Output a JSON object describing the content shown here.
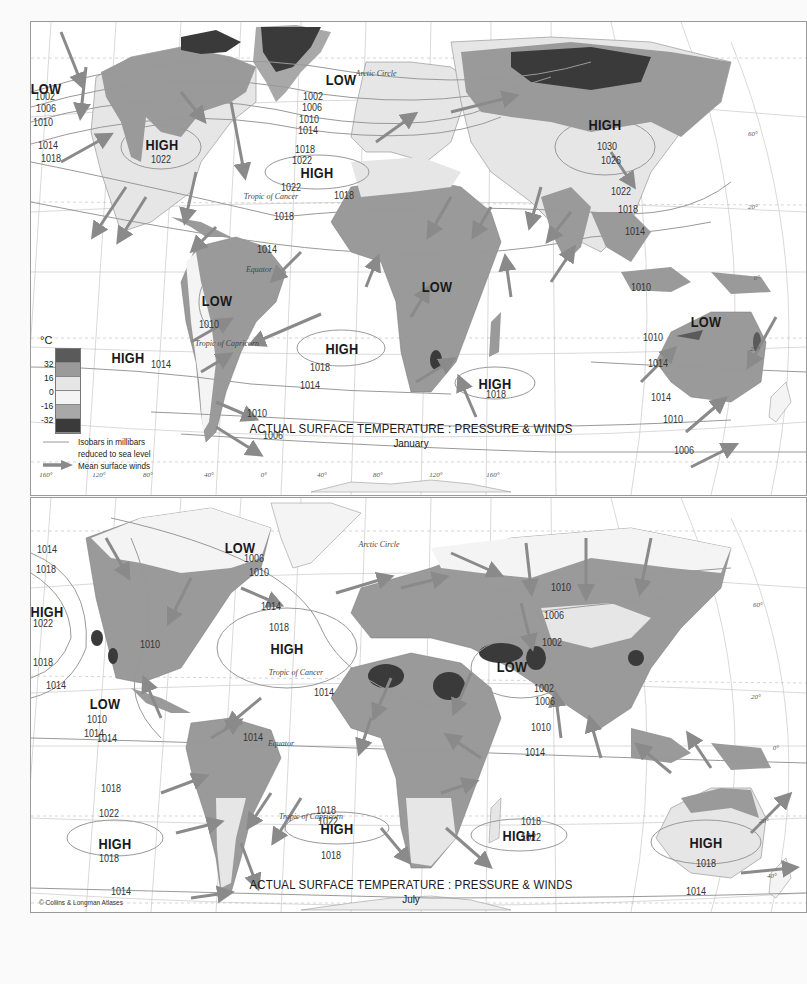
{
  "colors": {
    "temp_above_32": "#5a5a5a",
    "temp_16_32": "#9a9a9a",
    "temp_0_16": "#e6e6e6",
    "temp_minus16_0": "#f4f4f4",
    "temp_minus32_minus16": "#a8a8a8",
    "temp_below_minus32": "#3a3a3a",
    "ocean": "#ffffff",
    "isobar": "#999999",
    "wind_arrow": "#8a8a8a",
    "graticule": "#c8c8c8"
  },
  "legend": {
    "unit": "°C",
    "scale_values": [
      "32",
      "16",
      "0",
      "-16",
      "-32"
    ],
    "scale_swatches": [
      "#5a5a5a",
      "#9a9a9a",
      "#e6e6e6",
      "#f4f4f4",
      "#a8a8a8",
      "#3a3a3a"
    ],
    "isobar_key_line1": "Isobars in millibars",
    "isobar_key_line2": "reduced to sea level",
    "wind_key": "Mean surface winds"
  },
  "january": {
    "title": "ACTUAL SURFACE TEMPERATURE : PRESSURE & WINDS",
    "subtitle": "January",
    "pressure_centers": [
      {
        "label": "LOW",
        "x": 15,
        "y": 66
      },
      {
        "label": "HIGH",
        "x": 131,
        "y": 122
      },
      {
        "label": "LOW",
        "x": 310,
        "y": 57
      },
      {
        "label": "HIGH",
        "x": 286,
        "y": 150
      },
      {
        "label": "HIGH",
        "x": 574,
        "y": 102
      },
      {
        "label": "LOW",
        "x": 186,
        "y": 278
      },
      {
        "label": "LOW",
        "x": 406,
        "y": 264
      },
      {
        "label": "HIGH",
        "x": 311,
        "y": 326
      },
      {
        "label": "HIGH",
        "x": 97,
        "y": 335
      },
      {
        "label": "HIGH",
        "x": 464,
        "y": 361
      },
      {
        "label": "LOW",
        "x": 675,
        "y": 299
      }
    ],
    "isobars": [
      {
        "value": "1002",
        "x": 14,
        "y": 75
      },
      {
        "value": "1006",
        "x": 15,
        "y": 87
      },
      {
        "value": "1010",
        "x": 12,
        "y": 101
      },
      {
        "value": "1014",
        "x": 17,
        "y": 124
      },
      {
        "value": "1018",
        "x": 20,
        "y": 137
      },
      {
        "value": "1022",
        "x": 130,
        "y": 138
      },
      {
        "value": "1002",
        "x": 282,
        "y": 75
      },
      {
        "value": "1006",
        "x": 281,
        "y": 86
      },
      {
        "value": "1010",
        "x": 278,
        "y": 98
      },
      {
        "value": "1014",
        "x": 277,
        "y": 109
      },
      {
        "value": "1018",
        "x": 274,
        "y": 128
      },
      {
        "value": "1022",
        "x": 271,
        "y": 139
      },
      {
        "value": "1022",
        "x": 260,
        "y": 166
      },
      {
        "value": "1018",
        "x": 253,
        "y": 195
      },
      {
        "value": "1030",
        "x": 576,
        "y": 125
      },
      {
        "value": "1026",
        "x": 580,
        "y": 139
      },
      {
        "value": "1022",
        "x": 590,
        "y": 170
      },
      {
        "value": "1018",
        "x": 597,
        "y": 188
      },
      {
        "value": "1014",
        "x": 604,
        "y": 210
      },
      {
        "value": "1010",
        "x": 610,
        "y": 266
      },
      {
        "value": "1014",
        "x": 236,
        "y": 228
      },
      {
        "value": "1010",
        "x": 178,
        "y": 303
      },
      {
        "value": "1018",
        "x": 289,
        "y": 346
      },
      {
        "value": "1014",
        "x": 130,
        "y": 343
      },
      {
        "value": "1014",
        "x": 279,
        "y": 364
      },
      {
        "value": "1018",
        "x": 313,
        "y": 174
      },
      {
        "value": "1018",
        "x": 465,
        "y": 373
      },
      {
        "value": "1010",
        "x": 226,
        "y": 392
      },
      {
        "value": "1006",
        "x": 242,
        "y": 414
      },
      {
        "value": "1010",
        "x": 622,
        "y": 316
      },
      {
        "value": "1014",
        "x": 627,
        "y": 342
      },
      {
        "value": "1014",
        "x": 630,
        "y": 376
      },
      {
        "value": "1010",
        "x": 642,
        "y": 398
      },
      {
        "value": "1006",
        "x": 653,
        "y": 429
      }
    ],
    "parallels": [
      {
        "label": "Arctic Circle",
        "x": 345,
        "y": 52
      },
      {
        "label": "Tropic of Cancer",
        "x": 240,
        "y": 175
      },
      {
        "label": "Equator",
        "x": 228,
        "y": 248
      },
      {
        "label": "Tropic of Capricorn",
        "x": 196,
        "y": 322
      }
    ],
    "ticks": [
      {
        "label": "60°",
        "x": 722,
        "y": 112
      },
      {
        "label": "20°",
        "x": 722,
        "y": 185
      },
      {
        "label": "0°",
        "x": 726,
        "y": 256
      },
      {
        "label": "20°",
        "x": 724,
        "y": 327
      },
      {
        "label": "160°",
        "x": 15,
        "y": 453
      },
      {
        "label": "120°",
        "x": 68,
        "y": 453
      },
      {
        "label": "80°",
        "x": 117,
        "y": 453
      },
      {
        "label": "40°",
        "x": 178,
        "y": 453
      },
      {
        "label": "0°",
        "x": 233,
        "y": 453
      },
      {
        "label": "40°",
        "x": 291,
        "y": 453
      },
      {
        "label": "80°",
        "x": 347,
        "y": 453
      },
      {
        "label": "120°",
        "x": 405,
        "y": 453
      },
      {
        "label": "160°",
        "x": 462,
        "y": 453
      }
    ]
  },
  "july": {
    "title": "ACTUAL SURFACE TEMPERATURE : PRESSURE & WINDS",
    "subtitle": "July",
    "pressure_centers": [
      {
        "label": "LOW",
        "x": 209,
        "y": 49
      },
      {
        "label": "HIGH",
        "x": 16,
        "y": 113
      },
      {
        "label": "HIGH",
        "x": 256,
        "y": 150
      },
      {
        "label": "LOW",
        "x": 481,
        "y": 168
      },
      {
        "label": "LOW",
        "x": 74,
        "y": 205
      },
      {
        "label": "HIGH",
        "x": 84,
        "y": 345
      },
      {
        "label": "HIGH",
        "x": 306,
        "y": 330
      },
      {
        "label": "HIGH",
        "x": 488,
        "y": 337
      },
      {
        "label": "HIGH",
        "x": 675,
        "y": 344
      }
    ],
    "isobars": [
      {
        "value": "1014",
        "x": 16,
        "y": 52
      },
      {
        "value": "1018",
        "x": 15,
        "y": 72
      },
      {
        "value": "1022",
        "x": 12,
        "y": 126
      },
      {
        "value": "1018",
        "x": 12,
        "y": 165
      },
      {
        "value": "1014",
        "x": 25,
        "y": 188
      },
      {
        "value": "1010",
        "x": 119,
        "y": 147
      },
      {
        "value": "1006",
        "x": 223,
        "y": 61
      },
      {
        "value": "1010",
        "x": 228,
        "y": 75
      },
      {
        "value": "1014",
        "x": 240,
        "y": 109
      },
      {
        "value": "1018",
        "x": 248,
        "y": 130
      },
      {
        "value": "1014",
        "x": 293,
        "y": 195
      },
      {
        "value": "1010",
        "x": 530,
        "y": 90
      },
      {
        "value": "1006",
        "x": 523,
        "y": 118
      },
      {
        "value": "1002",
        "x": 521,
        "y": 145
      },
      {
        "value": "1002",
        "x": 513,
        "y": 191
      },
      {
        "value": "1006",
        "x": 514,
        "y": 204
      },
      {
        "value": "1010",
        "x": 510,
        "y": 230
      },
      {
        "value": "1014",
        "x": 504,
        "y": 255
      },
      {
        "value": "1010",
        "x": 66,
        "y": 222
      },
      {
        "value": "1014",
        "x": 63,
        "y": 236
      },
      {
        "value": "1014",
        "x": 76,
        "y": 241
      },
      {
        "value": "1014",
        "x": 222,
        "y": 240
      },
      {
        "value": "1018",
        "x": 80,
        "y": 291
      },
      {
        "value": "1022",
        "x": 78,
        "y": 316
      },
      {
        "value": "1018",
        "x": 78,
        "y": 361
      },
      {
        "value": "1014",
        "x": 90,
        "y": 394
      },
      {
        "value": "1010",
        "x": 94,
        "y": 423
      },
      {
        "value": "1018",
        "x": 295,
        "y": 313
      },
      {
        "value": "1022",
        "x": 297,
        "y": 324
      },
      {
        "value": "1018",
        "x": 300,
        "y": 358
      },
      {
        "value": "1018",
        "x": 500,
        "y": 324
      },
      {
        "value": "1022",
        "x": 500,
        "y": 340
      },
      {
        "value": "1018",
        "x": 675,
        "y": 366
      },
      {
        "value": "1014",
        "x": 665,
        "y": 394
      },
      {
        "value": "1010",
        "x": 656,
        "y": 423
      }
    ],
    "parallels": [
      {
        "label": "Arctic Circle",
        "x": 348,
        "y": 47
      },
      {
        "label": "Tropic of Cancer",
        "x": 265,
        "y": 175
      },
      {
        "label": "Equator",
        "x": 250,
        "y": 246
      },
      {
        "label": "Tropic of Capricorn",
        "x": 280,
        "y": 319
      }
    ],
    "ticks": [
      {
        "label": "60°",
        "x": 727,
        "y": 107
      },
      {
        "label": "20°",
        "x": 725,
        "y": 199
      },
      {
        "label": "0°",
        "x": 745,
        "y": 250
      },
      {
        "label": "20°",
        "x": 733,
        "y": 323
      },
      {
        "label": "40°",
        "x": 741,
        "y": 378
      },
      {
        "label": "120°",
        "x": 61,
        "y": 436
      },
      {
        "label": "80°",
        "x": 113,
        "y": 436
      },
      {
        "label": "40°",
        "x": 170,
        "y": 436
      },
      {
        "label": "0°",
        "x": 213,
        "y": 436
      },
      {
        "label": "40°",
        "x": 267,
        "y": 436
      },
      {
        "label": "80°",
        "x": 316,
        "y": 436
      },
      {
        "label": "120°",
        "x": 375,
        "y": 436
      },
      {
        "label": "160°",
        "x": 428,
        "y": 436
      }
    ],
    "copyright": "© Collins & Longman Atlases"
  }
}
